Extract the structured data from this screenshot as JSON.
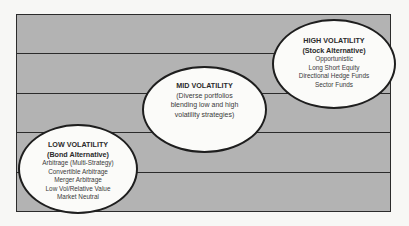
{
  "diagram": {
    "type": "volatility-spectrum",
    "bands": 5,
    "colors": {
      "background": "#f7f7f5",
      "band_fill": "#b3b3b3",
      "line": "#2b2b2b",
      "ellipse_fill": "#fbfbf9"
    },
    "low": {
      "title": "LOW VOLATILITY",
      "subtitle": "(Bond Alternative)",
      "items": [
        "Arbitrage (Multi-Strategy)",
        "Convertible Arbitrage",
        "Merger Arbitrage",
        "Low Vol/Relative Value",
        "Market Neutral"
      ]
    },
    "mid": {
      "title": "MID VOLATILITY",
      "description": [
        "(Diverse portfolios",
        "blending low and high",
        "volatility strategies)"
      ]
    },
    "high": {
      "title": "HIGH VOLATILITY",
      "subtitle": "(Stock Alternative)",
      "items": [
        "Opportunistic",
        "Long Short Equity",
        "Directional Hedge Funds",
        "Sector Funds"
      ]
    }
  }
}
